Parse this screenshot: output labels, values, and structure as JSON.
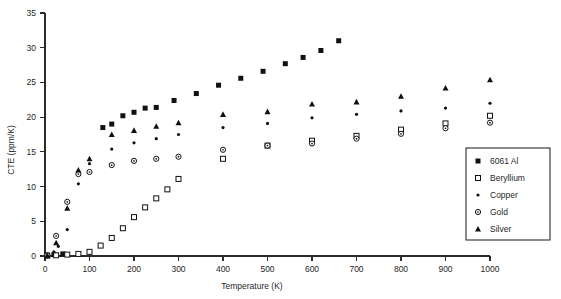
{
  "chart_data": {
    "type": "scatter",
    "title": "",
    "xlabel": "Temperature (K)",
    "ylabel": "CTE (ppm/K)",
    "xlim": [
      0,
      1000
    ],
    "ylim": [
      0,
      35
    ],
    "xticks": [
      0,
      100,
      200,
      300,
      400,
      500,
      600,
      700,
      800,
      900,
      1000
    ],
    "yticks": [
      0,
      5,
      10,
      15,
      20,
      25,
      30,
      35
    ],
    "grid": false,
    "legend_position": "right-inside-bottom",
    "series": [
      {
        "name": "6061 Al",
        "marker": "filled-square",
        "points": [
          [
            5,
            0.1
          ],
          [
            20,
            0.2
          ],
          [
            40,
            0.3
          ],
          [
            130,
            18.5
          ],
          [
            150,
            19.0
          ],
          [
            175,
            20.2
          ],
          [
            200,
            20.7
          ],
          [
            225,
            21.3
          ],
          [
            250,
            21.4
          ],
          [
            290,
            22.4
          ],
          [
            340,
            23.4
          ],
          [
            390,
            24.6
          ],
          [
            440,
            25.6
          ],
          [
            490,
            26.6
          ],
          [
            540,
            27.7
          ],
          [
            580,
            28.6
          ],
          [
            620,
            29.6
          ],
          [
            660,
            31.0
          ]
        ]
      },
      {
        "name": "Beryllium",
        "marker": "open-square",
        "points": [
          [
            5,
            0.05
          ],
          [
            25,
            0.1
          ],
          [
            50,
            0.2
          ],
          [
            75,
            0.3
          ],
          [
            100,
            0.6
          ],
          [
            125,
            1.5
          ],
          [
            150,
            2.6
          ],
          [
            175,
            4.0
          ],
          [
            200,
            5.6
          ],
          [
            225,
            7.0
          ],
          [
            250,
            8.3
          ],
          [
            275,
            9.6
          ],
          [
            300,
            11.1
          ],
          [
            400,
            14.0
          ],
          [
            500,
            15.9
          ],
          [
            600,
            16.6
          ],
          [
            700,
            17.3
          ],
          [
            800,
            18.2
          ],
          [
            900,
            19.1
          ],
          [
            1000,
            20.2
          ]
        ]
      },
      {
        "name": "Copper",
        "marker": "small-dot",
        "points": [
          [
            5,
            0.1
          ],
          [
            20,
            0.6
          ],
          [
            30,
            1.4
          ],
          [
            50,
            3.8
          ],
          [
            75,
            10.4
          ],
          [
            100,
            13.3
          ],
          [
            150,
            15.4
          ],
          [
            200,
            16.3
          ],
          [
            250,
            16.9
          ],
          [
            300,
            17.5
          ],
          [
            400,
            18.5
          ],
          [
            500,
            19.1
          ],
          [
            600,
            19.9
          ],
          [
            700,
            20.4
          ],
          [
            800,
            20.9
          ],
          [
            900,
            21.3
          ],
          [
            1000,
            22.0
          ]
        ]
      },
      {
        "name": "Gold",
        "marker": "open-circle-dot",
        "points": [
          [
            5,
            0.1
          ],
          [
            25,
            2.9
          ],
          [
            50,
            7.8
          ],
          [
            75,
            11.8
          ],
          [
            100,
            12.1
          ],
          [
            150,
            13.1
          ],
          [
            200,
            13.7
          ],
          [
            250,
            14.0
          ],
          [
            300,
            14.3
          ],
          [
            400,
            15.3
          ],
          [
            500,
            15.9
          ],
          [
            600,
            16.2
          ],
          [
            700,
            16.9
          ],
          [
            800,
            17.6
          ],
          [
            900,
            18.4
          ],
          [
            1000,
            19.2
          ]
        ]
      },
      {
        "name": "Silver",
        "marker": "filled-triangle",
        "points": [
          [
            5,
            0.1
          ],
          [
            25,
            1.9
          ],
          [
            50,
            6.9
          ],
          [
            75,
            12.4
          ],
          [
            100,
            14.0
          ],
          [
            150,
            17.5
          ],
          [
            200,
            18.1
          ],
          [
            250,
            18.7
          ],
          [
            300,
            19.2
          ],
          [
            400,
            20.4
          ],
          [
            500,
            20.8
          ],
          [
            600,
            21.9
          ],
          [
            700,
            22.2
          ],
          [
            800,
            23.0
          ],
          [
            900,
            24.2
          ],
          [
            1000,
            25.4
          ]
        ]
      }
    ],
    "legend_entries": [
      {
        "label": "6061 Al",
        "marker": "filled-square"
      },
      {
        "label": "Beryllium",
        "marker": "open-square"
      },
      {
        "label": "Copper",
        "marker": "small-dot"
      },
      {
        "label": "Gold",
        "marker": "open-circle-dot"
      },
      {
        "label": "Silver",
        "marker": "filled-triangle"
      }
    ],
    "colors": {
      "marker": "#111111",
      "axis": "#2b2b2b",
      "background": "#ffffff"
    }
  }
}
